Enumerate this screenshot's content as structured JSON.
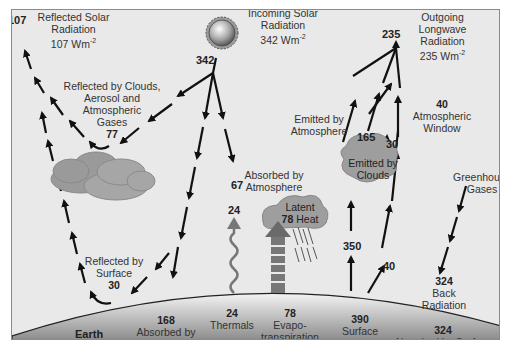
{
  "diagram": {
    "colors": {
      "background": "#e9e9e9",
      "frame": "#8a8a8a",
      "arrow": "#111111",
      "cloud": "#9a9a9a",
      "earth_top": "#f2f2f2",
      "earth_bottom": "#7a7a7a",
      "sun": "#b0b0b0"
    },
    "labels": {
      "reflected_solar": {
        "line1": "Reflected Solar",
        "line2": "Radiation",
        "line3": "107 Wm",
        "exp": "-2",
        "value": "107"
      },
      "incoming_solar": {
        "line1": "Incoming Solar",
        "line2": "Radiation",
        "line3": "342 Wm",
        "exp": "-2",
        "value": "342"
      },
      "outgoing_longwave": {
        "line1": "Outgoing",
        "line2": "Longwave",
        "line3": "Radiation",
        "line4": "235 Wm",
        "exp": "-2",
        "value": "235"
      },
      "reflected_clouds": {
        "line1": "Reflected by Clouds,",
        "line2": "Aerosol and",
        "line3": "Atmospheric",
        "line4": "Gases",
        "value": "77"
      },
      "emitted_atmosphere": {
        "line1": "Emitted by",
        "line2": "Atmosphere",
        "value": "165"
      },
      "atmospheric_window": {
        "value": "40",
        "line1": "Atmospheric",
        "line2": "Window"
      },
      "emitted_clouds": {
        "line1": "Emitted by",
        "line2": "Clouds",
        "value": "30"
      },
      "absorbed_atmosphere": {
        "line1": "Absorbed by",
        "line2": "Atmosphere",
        "value": "67"
      },
      "greenhouse_gases": {
        "line1": "Greenhouse",
        "line2": "Gases"
      },
      "latent_heat": {
        "line1": "Latent",
        "value": "78",
        "line2": "Heat"
      },
      "thermals_top": {
        "value": "24"
      },
      "surface_rad_350": {
        "value": "350"
      },
      "surface_rad_40": {
        "value": "40"
      },
      "reflected_surface": {
        "line1": "Reflected by",
        "line2": "Surface",
        "value": "30"
      },
      "back_radiation": {
        "value": "324",
        "line1": "Back",
        "line2": "Radiation"
      },
      "earth": {
        "label": "Earth"
      },
      "absorbed_surface_168": {
        "value": "168",
        "line1": "Absorbed by",
        "line2": "Surface"
      },
      "thermals": {
        "value": "24",
        "line1": "Thermals"
      },
      "evapotranspiration": {
        "value": "78",
        "line1": "Evapo-",
        "line2": "transpiration"
      },
      "surface_radiation": {
        "value": "390",
        "line1": "Surface",
        "line2": "Radiation"
      },
      "absorbed_surface_324": {
        "value": "324",
        "line1": "Absorbed by Surface"
      }
    }
  }
}
